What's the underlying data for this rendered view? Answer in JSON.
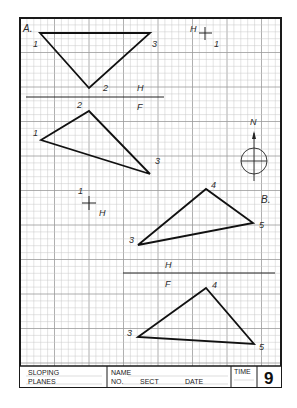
{
  "sheet": {
    "border": {
      "x": 20,
      "y": 18,
      "w": 261,
      "h": 369
    },
    "grid": {
      "pitch": 6.9,
      "major_every": 5,
      "color_minor": "#c8c8c8",
      "color_major": "#9a9a9a"
    }
  },
  "problem_a": {
    "label": "A.",
    "top_view": {
      "points": {
        "1": [
          40,
          33
        ],
        "2": [
          89,
          88
        ],
        "3": [
          150,
          33
        ]
      },
      "labels": {
        "p1": "1",
        "p2": "2",
        "p3": "3"
      }
    },
    "fold_line": {
      "x1": 26,
      "x2": 164,
      "y": 97,
      "upper": "H",
      "lower": "F"
    },
    "front_view": {
      "points": {
        "1": [
          41,
          140
        ],
        "2": [
          89,
          111
        ],
        "3": [
          150,
          174
        ]
      },
      "labels": {
        "p1": "1",
        "p2": "2",
        "p3": "3"
      }
    },
    "ref_mark_top": {
      "x": 205,
      "y": 33,
      "letter": "H",
      "num": "1"
    },
    "ref_mark_mid": {
      "x": 89,
      "y": 203,
      "letter": "H",
      "num": "1"
    }
  },
  "compass": {
    "label": "N",
    "cx": 254,
    "cy": 161,
    "r": 13
  },
  "problem_b": {
    "label": "B.",
    "top_view": {
      "points": {
        "3": [
          138,
          245
        ],
        "4": [
          206,
          189
        ],
        "5": [
          253,
          223
        ]
      },
      "labels": {
        "p3": "3",
        "p4": "4",
        "p5": "5"
      }
    },
    "fold_line": {
      "x1": 123,
      "x2": 275,
      "y": 273,
      "upper": "H",
      "lower": "F"
    },
    "front_view": {
      "points": {
        "3": [
          138,
          337
        ],
        "4": [
          206,
          288
        ],
        "5": [
          254,
          344
        ]
      },
      "labels": {
        "p3": "3",
        "p4": "4",
        "p5": "5"
      }
    }
  },
  "title_block": {
    "title_line1": "SLOPING",
    "title_line2": "PLANES",
    "name_label": "NAME",
    "no_label": "NO.",
    "sect_label": "SECT",
    "date_label": "DATE",
    "time_label": "TIME",
    "sheet_number": "9"
  }
}
